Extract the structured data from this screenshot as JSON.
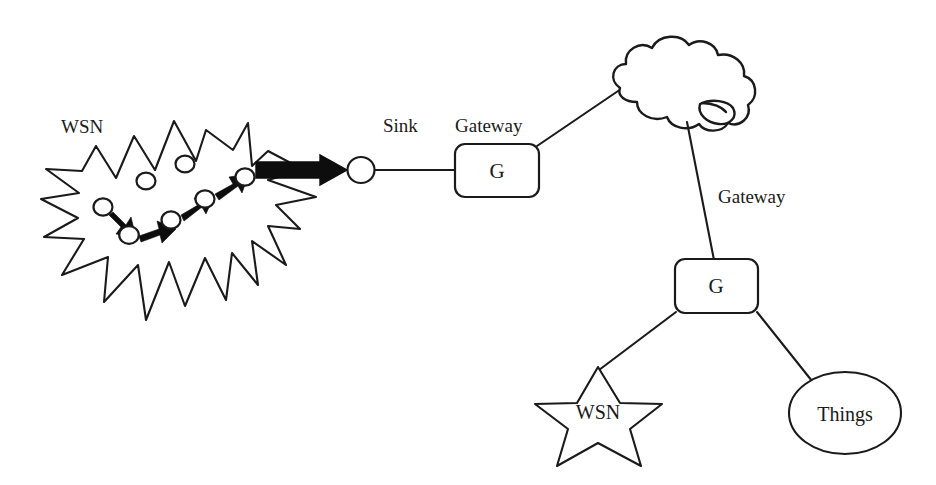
{
  "diagram": {
    "background_color": "#ffffff",
    "stroke_color": "#1a1a1a",
    "labels": {
      "wsn_burst": "WSN",
      "sink": "Sink",
      "gateway_top": "Gateway",
      "gateway_bottom": "Gateway",
      "gateway_top_letter": "G",
      "gateway_bottom_letter": "G",
      "wsn_star": "WSN",
      "things": "Things"
    },
    "nodes": [
      {
        "name": "wsn-burst-cloud",
        "shape": "starburst",
        "label": "WSN"
      },
      {
        "name": "sensor-node-1",
        "shape": "circle",
        "cx": 103,
        "cy": 207
      },
      {
        "name": "sensor-node-2",
        "shape": "circle",
        "cx": 129,
        "cy": 235
      },
      {
        "name": "sensor-node-3",
        "shape": "circle",
        "cx": 171,
        "cy": 220
      },
      {
        "name": "sensor-node-4",
        "shape": "circle",
        "cx": 205,
        "cy": 199
      },
      {
        "name": "sensor-node-5",
        "shape": "circle",
        "cx": 245,
        "cy": 177
      },
      {
        "name": "sensor-node-idle-1",
        "shape": "circle",
        "cx": 146,
        "cy": 181
      },
      {
        "name": "sensor-node-idle-2",
        "shape": "circle",
        "cx": 185,
        "cy": 164
      },
      {
        "name": "sink-node",
        "shape": "circle",
        "cx": 361,
        "cy": 170,
        "label": "Sink"
      },
      {
        "name": "gateway-top",
        "shape": "rounded-rect",
        "label": "G"
      },
      {
        "name": "internet-cloud",
        "shape": "cloud"
      },
      {
        "name": "gateway-bottom",
        "shape": "rounded-rect",
        "label": "G"
      },
      {
        "name": "wsn-star",
        "shape": "five-point-star",
        "label": "WSN"
      },
      {
        "name": "things-ellipse",
        "shape": "ellipse",
        "label": "Things"
      }
    ],
    "connections": [
      {
        "name": "hop-1-2",
        "from": "sensor-node-1",
        "to": "sensor-node-2",
        "style": "solid-arrow"
      },
      {
        "name": "hop-2-3",
        "from": "sensor-node-2",
        "to": "sensor-node-3",
        "style": "solid-arrow"
      },
      {
        "name": "hop-3-4",
        "from": "sensor-node-3",
        "to": "sensor-node-4",
        "style": "solid-arrow"
      },
      {
        "name": "hop-4-5",
        "from": "sensor-node-4",
        "to": "sensor-node-5",
        "style": "solid-arrow"
      },
      {
        "name": "wsn-to-sink",
        "from": "sensor-node-5",
        "to": "sink-node",
        "style": "block-arrow"
      },
      {
        "name": "sink-to-gateway-top",
        "from": "sink-node",
        "to": "gateway-top",
        "style": "line"
      },
      {
        "name": "gateway-top-to-cloud",
        "from": "gateway-top",
        "to": "internet-cloud",
        "style": "line"
      },
      {
        "name": "cloud-to-gateway-bottom",
        "from": "internet-cloud",
        "to": "gateway-bottom",
        "style": "line"
      },
      {
        "name": "gateway-bottom-to-wsn-star",
        "from": "gateway-bottom",
        "to": "wsn-star",
        "style": "line"
      },
      {
        "name": "gateway-bottom-to-things",
        "from": "gateway-bottom",
        "to": "things-ellipse",
        "style": "line"
      }
    ]
  }
}
